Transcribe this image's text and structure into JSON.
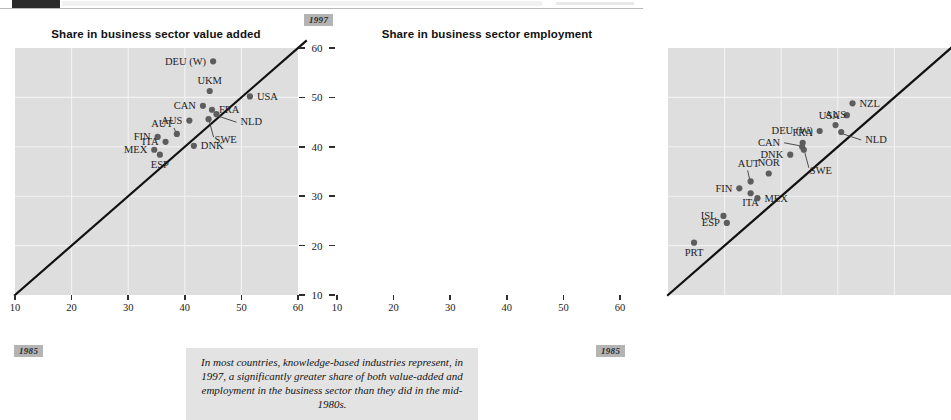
{
  "header": {
    "dark_block": "",
    "ghost_bar": ""
  },
  "charts": {
    "left": {
      "title": "Share in business sector value added",
      "xlabel": "",
      "ylabel": ""
    },
    "right": {
      "title": "Share in business sector employment",
      "xlabel": "",
      "ylabel": ""
    }
  },
  "axis": {
    "x_ticks": [
      "10",
      "20",
      "30",
      "40",
      "50",
      "60"
    ],
    "y_ticks": [
      "60",
      "50",
      "40",
      "30",
      "20",
      "10"
    ]
  },
  "chips": {
    "year_new": "1997",
    "year_old_left": "1985",
    "year_old_right": "1985"
  },
  "caption": {
    "text": "In most countries, knowledge-based industries represent, in 1997, a significantly greater share of both value-added and employment in the business sector than they did in the mid-1980s."
  },
  "chart_data": [
    {
      "type": "scatter",
      "id": "value-added",
      "title": "Share in business sector value added",
      "xlabel": "1985",
      "ylabel": "1997",
      "xlim": [
        10,
        60
      ],
      "ylim": [
        10,
        60
      ],
      "grid": true,
      "legend": "none",
      "annotations": [
        "45-degree reference line"
      ],
      "points": [
        {
          "label": "DEU (W)",
          "x": 45.0,
          "y": 57.3,
          "label_pos": "left"
        },
        {
          "label": "UKM",
          "x": 44.4,
          "y": 51.3,
          "label_pos": "above"
        },
        {
          "label": "USA",
          "x": 51.5,
          "y": 50.2,
          "label_pos": "right"
        },
        {
          "label": "CAN",
          "x": 43.2,
          "y": 48.3,
          "label_pos": "left"
        },
        {
          "label": "FRA",
          "x": 44.8,
          "y": 47.5,
          "label_pos": "right"
        },
        {
          "label": "NLD",
          "x": 45.6,
          "y": 46.6,
          "label_pos": "leader-right"
        },
        {
          "label": "AUS",
          "x": 40.8,
          "y": 45.3,
          "label_pos": "left"
        },
        {
          "label": "SWE",
          "x": 44.2,
          "y": 45.6,
          "label_pos": "leader-below"
        },
        {
          "label": "AUT",
          "x": 38.6,
          "y": 42.6,
          "label_pos": "above-left"
        },
        {
          "label": "FIN",
          "x": 35.2,
          "y": 42.0,
          "label_pos": "left"
        },
        {
          "label": "ITA",
          "x": 36.6,
          "y": 41.0,
          "label_pos": "left"
        },
        {
          "label": "DNK",
          "x": 41.6,
          "y": 40.2,
          "label_pos": "right"
        },
        {
          "label": "MEX",
          "x": 34.6,
          "y": 39.4,
          "label_pos": "left"
        },
        {
          "label": "ESP",
          "x": 35.6,
          "y": 38.4,
          "label_pos": "below"
        }
      ]
    },
    {
      "type": "scatter",
      "id": "employment",
      "title": "Share in business sector employment",
      "xlabel": "1985",
      "ylabel": "1997",
      "xlim": [
        10,
        60
      ],
      "ylim": [
        10,
        60
      ],
      "grid": true,
      "legend": "none",
      "annotations": [
        "45-degree reference line"
      ],
      "points": [
        {
          "label": "NZL",
          "x": 42.6,
          "y": 48.8,
          "label_pos": "right"
        },
        {
          "label": "USA",
          "x": 41.6,
          "y": 46.4,
          "label_pos": "left"
        },
        {
          "label": "AUS",
          "x": 39.6,
          "y": 44.4,
          "label_pos": "above"
        },
        {
          "label": "DEU (W)",
          "x": 36.8,
          "y": 43.2,
          "label_pos": "left"
        },
        {
          "label": "NLD",
          "x": 40.6,
          "y": 43.0,
          "label_pos": "leader-right"
        },
        {
          "label": "FRA",
          "x": 33.8,
          "y": 40.8,
          "label_pos": "above"
        },
        {
          "label": "CAN",
          "x": 33.7,
          "y": 40.0,
          "label_pos": "leader-left"
        },
        {
          "label": "SWE",
          "x": 34.0,
          "y": 39.4,
          "label_pos": "leader-below"
        },
        {
          "label": "DNK",
          "x": 31.6,
          "y": 38.4,
          "label_pos": "left"
        },
        {
          "label": "NOR",
          "x": 27.8,
          "y": 34.6,
          "label_pos": "above"
        },
        {
          "label": "AUT",
          "x": 24.6,
          "y": 33.0,
          "label_pos": "leader-above"
        },
        {
          "label": "FIN",
          "x": 22.6,
          "y": 31.6,
          "label_pos": "left"
        },
        {
          "label": "ITA",
          "x": 24.6,
          "y": 30.6,
          "label_pos": "below"
        },
        {
          "label": "MEX",
          "x": 25.8,
          "y": 29.6,
          "label_pos": "right"
        },
        {
          "label": "ISL",
          "x": 19.8,
          "y": 26.0,
          "label_pos": "left"
        },
        {
          "label": "ESP",
          "x": 20.4,
          "y": 24.6,
          "label_pos": "left"
        },
        {
          "label": "PRT",
          "x": 14.6,
          "y": 20.6,
          "label_pos": "below"
        }
      ]
    }
  ]
}
